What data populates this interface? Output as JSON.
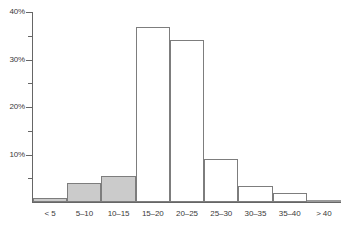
{
  "chart_data": {
    "type": "bar",
    "title": "",
    "subtitle": "",
    "xlabel": "",
    "ylabel": "",
    "grid": false,
    "legend": "none",
    "categories": [
      "< 5",
      "5–10",
      "10–15",
      "15–20",
      "20–25",
      "25–30",
      "30–35",
      "35–40",
      "> 40"
    ],
    "values": [
      0.8,
      4.0,
      5.4,
      36.8,
      34.2,
      9.0,
      3.4,
      2.0,
      0.4
    ],
    "value_suffix": "%",
    "ylim": [
      0,
      40
    ],
    "xlim_categories": 9,
    "y_ticks_major": [
      0,
      10,
      20,
      30,
      40
    ],
    "y_ticks_major_labels": [
      "",
      "10%",
      "20%",
      "30%",
      "40%"
    ],
    "y_ticks_minor": [
      5,
      15,
      25,
      35
    ],
    "bar_fill_flags": [
      true,
      true,
      true,
      false,
      false,
      false,
      false,
      false,
      true
    ],
    "colors": {
      "bar_fill": "#cbcbcb",
      "bar_stroke": "#7d7d7d",
      "axis": "#666666",
      "text": "#3a3a3a",
      "background": "#ffffff"
    }
  },
  "axes": {
    "y_labels": [
      {
        "text": "40%",
        "value": 40
      },
      {
        "text": "30%",
        "value": 30
      },
      {
        "text": "20%",
        "value": 20
      },
      {
        "text": "10%",
        "value": 10
      }
    ]
  }
}
